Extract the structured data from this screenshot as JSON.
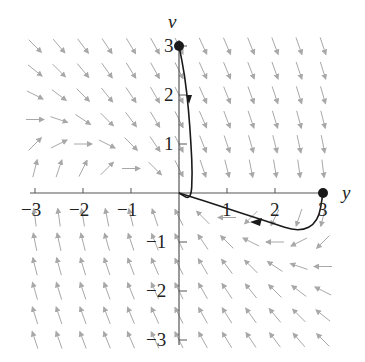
{
  "chart_data": {
    "type": "phase-portrait",
    "title": "",
    "xlabel": "y",
    "ylabel": "v",
    "xlim": [
      -3,
      3
    ],
    "ylim": [
      -3,
      3
    ],
    "x_ticks": [
      "-3",
      "-2",
      "-1",
      "1",
      "2",
      "3"
    ],
    "y_ticks": [
      "3",
      "2",
      "1",
      "-1",
      "-2",
      "-3"
    ],
    "initial_points": [
      [
        0,
        3
      ],
      [
        3,
        0
      ]
    ],
    "trajectories": [
      {
        "name": "from (0,3)",
        "points": [
          [
            0,
            3
          ],
          [
            0.12,
            2.4
          ],
          [
            0.2,
            1.7
          ],
          [
            0.25,
            1.0
          ],
          [
            0.28,
            0.4
          ],
          [
            0.25,
            -0.15
          ],
          [
            0.0,
            0.0
          ]
        ]
      },
      {
        "name": "from (3,0)",
        "points": [
          [
            3,
            0
          ],
          [
            2.9,
            -0.6
          ],
          [
            2.5,
            -0.8
          ],
          [
            1.9,
            -0.6
          ],
          [
            1.2,
            -0.38
          ],
          [
            0.5,
            -0.15
          ],
          [
            0,
            0
          ]
        ]
      }
    ],
    "vector_field": "slope field on integer/half-integer grid, arrows pointing down for v>0, up for v<0"
  },
  "axis": {
    "x_label": "y",
    "y_label": "v"
  },
  "ticks": {
    "x": [
      {
        "v": -3,
        "t": "−3"
      },
      {
        "v": -2,
        "t": "−2"
      },
      {
        "v": -1,
        "t": "−1"
      },
      {
        "v": 1,
        "t": "1"
      },
      {
        "v": 2,
        "t": "2"
      },
      {
        "v": 3,
        "t": "3"
      }
    ],
    "y": [
      {
        "v": 3,
        "t": "3"
      },
      {
        "v": 2,
        "t": "2"
      },
      {
        "v": 1,
        "t": "1"
      },
      {
        "v": -1,
        "t": "−1"
      },
      {
        "v": -2,
        "t": "−2"
      },
      {
        "v": -3,
        "t": "−3"
      }
    ]
  },
  "colors": {
    "axis": "#555555",
    "field": "#a8a8a8",
    "curve": "#1a1a1a"
  }
}
